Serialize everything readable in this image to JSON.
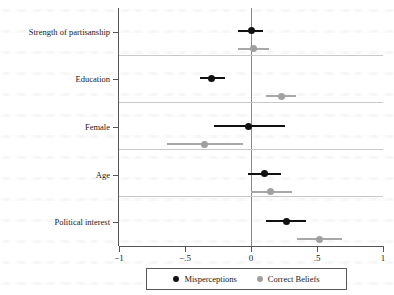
{
  "chart_data": {
    "type": "scatter",
    "subtype": "coefficient-plot",
    "title": "",
    "xlabel": "",
    "ylabel": "",
    "xlim": [
      -1,
      1
    ],
    "grid": true,
    "legend_position": "bottom",
    "x_ticks": [
      {
        "value": -1,
        "label": "−1"
      },
      {
        "value": -0.5,
        "label": "−.5"
      },
      {
        "value": 0,
        "label": "0"
      },
      {
        "value": 0.5,
        "label": ".5"
      },
      {
        "value": 1,
        "label": "1"
      }
    ],
    "zero_reference_line": 0,
    "categories": [
      "Strength of partisanship",
      "Education",
      "Female",
      "Age",
      "Political interest"
    ],
    "series": [
      {
        "name": "Misperceptions",
        "color": "#111111",
        "marker": "filled-circle",
        "values": [
          0.0,
          -0.3,
          -0.02,
          0.1,
          0.27
        ],
        "ci_low": [
          -0.1,
          -0.39,
          -0.28,
          -0.02,
          0.11
        ],
        "ci_high": [
          0.09,
          -0.2,
          0.26,
          0.23,
          0.42
        ]
      },
      {
        "name": "Correct Beliefs",
        "color": "#a0a0a0",
        "marker": "filled-circle",
        "values": [
          0.02,
          0.23,
          -0.35,
          0.15,
          0.52
        ],
        "ci_low": [
          -0.1,
          0.11,
          -0.64,
          0.0,
          0.35
        ],
        "ci_high": [
          0.14,
          0.34,
          -0.06,
          0.31,
          0.69
        ]
      }
    ]
  },
  "legend": {
    "entries": [
      {
        "label": "Misperceptions",
        "color": "#111111"
      },
      {
        "label": "Correct Beliefs",
        "color": "#a0a0a0"
      }
    ]
  }
}
